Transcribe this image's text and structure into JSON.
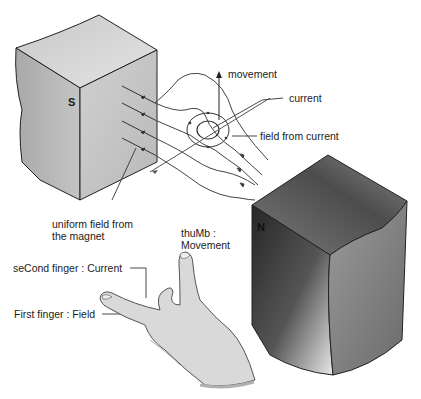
{
  "diagram": {
    "magnets": {
      "south": {
        "pole_label": "S"
      },
      "north": {
        "pole_label": "N"
      }
    },
    "labels": {
      "movement": "movement",
      "current": "current",
      "field_from_current": "field from current",
      "uniform_field_line1": "uniform field from",
      "uniform_field_line2": "the magnet",
      "thumb_line1": "thuMb :",
      "thumb_line2": "Movement",
      "second_finger": "seCond finger : Current",
      "first_finger": "First finger : Field"
    },
    "colors": {
      "line": "#333333",
      "magnet_light": "#d6d6d6",
      "magnet_mid": "#b8b8b8",
      "magnet_dark": "#2e2e2e",
      "hand": "#d9d9d9"
    }
  }
}
